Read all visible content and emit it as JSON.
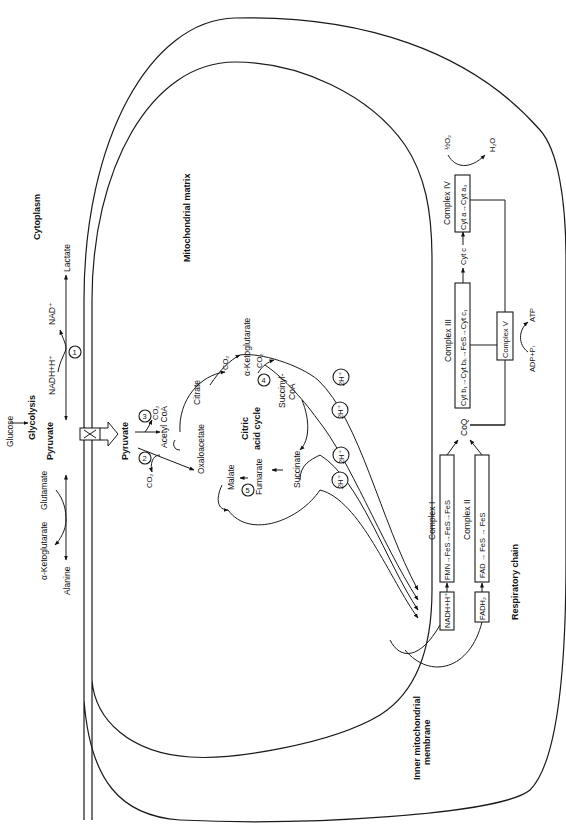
{
  "regions": {
    "cytoplasm": "Cytoplasm",
    "matrix": "Mitochondrial matrix",
    "inner_membrane_line1": "Inner mitochondrial",
    "inner_membrane_line2": "membrane",
    "respiratory_chain": "Respiratory chain"
  },
  "cytoplasm_pathway": {
    "glucose": "Glucose",
    "glycolysis": "Glycolysis",
    "pyruvate": "Pyruvate",
    "lactate": "Lactate",
    "nadh": "NADH+H⁺",
    "nad": "NAD⁺",
    "alanine": "Alanine",
    "glutamate": "Glutamate",
    "akg": "α-Ketoglutarate",
    "step1": "1"
  },
  "matrix_pathway": {
    "pyruvate": "Pyruvate",
    "step2": "2",
    "step3": "3",
    "co2_a": "CO₂",
    "co2_b": "CO₂",
    "acetyl_coa": "Acetyl CoA",
    "oxaloacetate": "Oxaloacetate",
    "citrate": "Citrate",
    "co2_c": "CO₂",
    "akg": "α-Ketoglutarate",
    "step4": "4",
    "co2_d": "CO₂",
    "succinyl_line1": "Succinyl-",
    "succinyl_line2": "CoA",
    "succinate": "Succinate",
    "fumarate": "Fumarate",
    "step5": "5",
    "malate": "Malate",
    "cycle_line1": "Citric",
    "cycle_line2": "acid cycle",
    "h_labels": [
      "2H⁺",
      "2H⁺",
      "2H⁺",
      "2H⁺"
    ]
  },
  "respiratory": {
    "nadh_box": "NADH+H⁺",
    "fadh2_box": "FADH₂",
    "complex1_title": "Complex I",
    "complex1_content": "FMN→FeS→FeS→FeS",
    "complex2_title": "Complex II",
    "complex2_content": "FAD → FeS → FeS",
    "coq": "CoQ",
    "complex3_title": "Complex III",
    "complex3_content": "Cyt b₁→Cyt bₖ→FeS→Cyt c₁",
    "cyt_c": "Cyt c",
    "complex4_title": "Complex IV",
    "complex4_content": "Cyt a→Cyt a₃",
    "half_o2": "½O₂",
    "h2o": "H₂O",
    "complex5": "Complex V",
    "adp": "ADP+Pᵢ",
    "atp": "ATP"
  }
}
